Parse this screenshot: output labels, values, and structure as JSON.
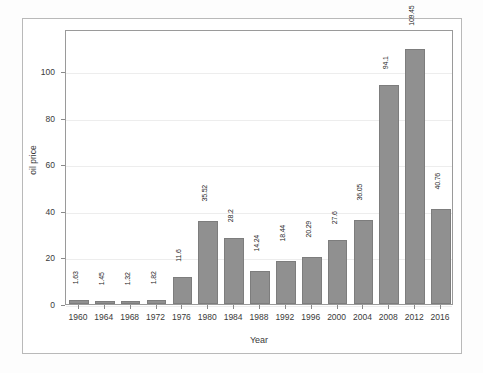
{
  "chart_data": {
    "type": "bar",
    "title": "",
    "xlabel": "Year",
    "ylabel": "oil price",
    "categories": [
      "1960",
      "1964",
      "1968",
      "1972",
      "1976",
      "1980",
      "1984",
      "1988",
      "1992",
      "1996",
      "2000",
      "2004",
      "2008",
      "2012",
      "2016"
    ],
    "values": [
      1.63,
      1.45,
      1.32,
      1.82,
      11.6,
      35.52,
      28.2,
      14.24,
      18.44,
      20.29,
      27.6,
      36.05,
      94.1,
      109.45,
      40.76
    ],
    "value_labels": [
      "1.63",
      "1.45",
      "1.32",
      "1.82",
      "11.6",
      "35.52",
      "28.2",
      "14.24",
      "18.44",
      "20.29",
      "27.6",
      "36.05",
      "94.1",
      "109.45",
      "40.76"
    ],
    "ylim": [
      0,
      118
    ],
    "yticks": [
      0,
      20,
      40,
      60,
      80,
      100
    ],
    "ytick_labels": [
      "0",
      "20",
      "40",
      "60",
      "80",
      "100"
    ],
    "grid": true,
    "legend": "none",
    "bar_color": "#909090",
    "bar_edge_color": "#7d7d7d",
    "gridline_color": "#ededed",
    "axis_color": "#9a9a9a",
    "text_color": "#3a3a3a",
    "label_orientation": "vertical",
    "background": "#ffffff"
  }
}
